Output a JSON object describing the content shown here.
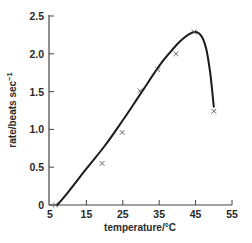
{
  "chart_data": {
    "type": "line",
    "title": "",
    "xlabel": "temperature/°C",
    "ylabel": "rate/beats sec⁻¹",
    "xlim": [
      5,
      55
    ],
    "ylim": [
      0,
      2.5
    ],
    "x_ticks": [
      5,
      15,
      25,
      35,
      45,
      55
    ],
    "x_tick_labels": [
      "5",
      "15",
      "25",
      "35",
      "45",
      "55"
    ],
    "y_ticks": [
      0,
      0.5,
      1.0,
      1.5,
      2.0,
      2.5
    ],
    "y_tick_labels": [
      "0",
      "0.5",
      "1.0",
      "1.5",
      "2.0",
      "2.5"
    ],
    "grid": false,
    "legend": null,
    "series": [
      {
        "name": "measured",
        "style": "markers",
        "marker": "x",
        "x": [
          6.5,
          19.3,
          24.8,
          29.7,
          34.6,
          39.6,
          44.6,
          50
        ],
        "y": [
          0.0,
          0.55,
          0.96,
          1.51,
          1.79,
          2.0,
          2.29,
          1.24
        ]
      },
      {
        "name": "fitted curve",
        "style": "smooth-line",
        "x": [
          7,
          10,
          15,
          20,
          25,
          30,
          35,
          38,
          40,
          42,
          44,
          45,
          46,
          47,
          48,
          49,
          50
        ],
        "y": [
          0.0,
          0.17,
          0.48,
          0.78,
          1.12,
          1.48,
          1.84,
          2.02,
          2.13,
          2.22,
          2.28,
          2.29,
          2.27,
          2.2,
          2.05,
          1.75,
          1.3
        ]
      }
    ]
  },
  "colors": {
    "ink": "#1a1a1a",
    "axis": "#444444",
    "marker": "#555555",
    "background": "#ffffff"
  }
}
